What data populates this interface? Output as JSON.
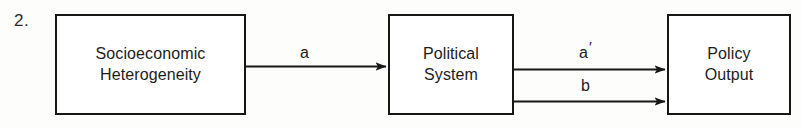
{
  "diagram": {
    "item_number": "2.",
    "nodes": [
      {
        "id": "socioeconomic",
        "label": "Socioeconomic\nHeterogeneity"
      },
      {
        "id": "political",
        "label": "Political\nSystem"
      },
      {
        "id": "policy",
        "label": "Policy\nOutput"
      }
    ],
    "edges": [
      {
        "id": "a",
        "label": "a",
        "from": "socioeconomic",
        "to": "political"
      },
      {
        "id": "a-prime",
        "label": "a",
        "prime": "′",
        "from": "political",
        "to": "policy"
      },
      {
        "id": "b",
        "label": "b",
        "from": "political",
        "to": "policy"
      }
    ],
    "colors": {
      "stroke": "#171717",
      "text": "#1c1c1c",
      "background": "#fdfdfc",
      "box_fill": "#ffffff"
    }
  }
}
